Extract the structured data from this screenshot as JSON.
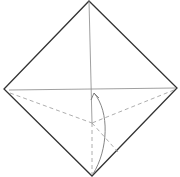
{
  "diagram": {
    "title": "Origami fold diagram",
    "colors": {
      "outline": "#333333",
      "crease": "#888888",
      "dashed": "#999999",
      "arrow": "#777777",
      "background": "#ffffff"
    },
    "square": {
      "top": [
        89,
        1
      ],
      "right": [
        177,
        88
      ],
      "bottom": [
        92,
        176
      ],
      "left": [
        4,
        89
      ]
    },
    "creases": [
      {
        "type": "valley-solid",
        "from": [
          89,
          1
        ],
        "to": [
          92,
          123
        ]
      },
      {
        "type": "valley-solid",
        "from": [
          9,
          90
        ],
        "to": [
          176,
          88
        ]
      }
    ],
    "dashed_lines": [
      {
        "from": [
          10,
          93
        ],
        "to": [
          92,
          123
        ]
      },
      {
        "from": [
          174,
          90
        ],
        "to": [
          92,
          123
        ]
      },
      {
        "from": [
          92,
          123
        ],
        "to": [
          92,
          174
        ]
      },
      {
        "from": [
          92,
          123
        ],
        "to": [
          118,
          152
        ]
      }
    ],
    "arrow": {
      "from": [
        93,
        174
      ],
      "to": [
        94,
        93
      ],
      "direction": "up",
      "label": "fold up"
    }
  }
}
